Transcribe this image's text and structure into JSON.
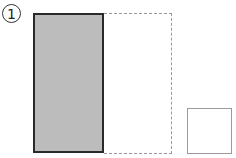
{
  "label": {
    "text": "1"
  },
  "shapes": {
    "gray_rect": {
      "fill": "#bcbcbc",
      "stroke": "#2a2a2a"
    },
    "dashed_rect": {
      "stroke": "#9a9a9a",
      "style": "dashed"
    },
    "small_square": {
      "stroke": "#9a9a9a"
    }
  }
}
